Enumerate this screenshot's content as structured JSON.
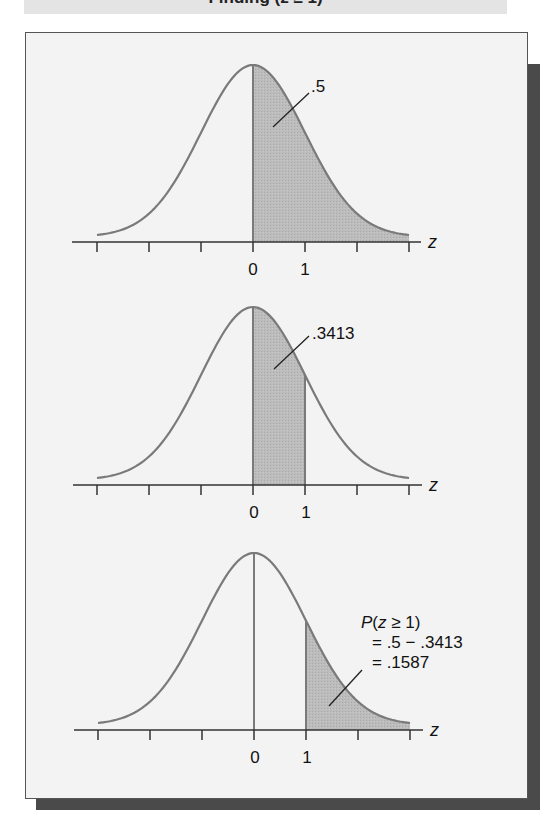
{
  "banner": {
    "title": "Finding (z ≥ 1)"
  },
  "colors": {
    "curve": "#7a7a7a",
    "shade": "#b9b9b9",
    "axis": "#333333",
    "frame_bg": "#f3f3f3",
    "shadow": "#4a4a4a"
  },
  "chart_data": [
    {
      "type": "area",
      "title": "Standard normal curve, area from z = 0 to +∞",
      "xlabel": "z",
      "ylabel": "",
      "x_ticks": [
        -3,
        -2,
        -1,
        0,
        1,
        2,
        3
      ],
      "x_tick_labels": [
        "",
        "",
        "",
        "0",
        "1",
        "",
        ""
      ],
      "xlim": [
        -3,
        3
      ],
      "shaded_interval": [
        0,
        3
      ],
      "annotation": ".5",
      "area": 0.5,
      "grid": false
    },
    {
      "type": "area",
      "title": "Standard normal curve, area from z = 0 to z = 1",
      "xlabel": "z",
      "ylabel": "",
      "x_ticks": [
        -3,
        -2,
        -1,
        0,
        1,
        2,
        3
      ],
      "x_tick_labels": [
        "",
        "",
        "",
        "0",
        "1",
        "",
        ""
      ],
      "xlim": [
        -3,
        3
      ],
      "shaded_interval": [
        0,
        1
      ],
      "annotation": ".3413",
      "area": 0.3413,
      "grid": false
    },
    {
      "type": "area",
      "title": "Standard normal curve, area for z ≥ 1",
      "xlabel": "z",
      "ylabel": "",
      "x_ticks": [
        -3,
        -2,
        -1,
        0,
        1,
        2,
        3
      ],
      "x_tick_labels": [
        "",
        "",
        "",
        "0",
        "1",
        "",
        ""
      ],
      "xlim": [
        -3,
        3
      ],
      "shaded_interval": [
        1,
        3
      ],
      "annotation_lines": [
        "P(z ≥ 1)",
        "= .5 − .3413",
        "= .1587"
      ],
      "area": 0.1587,
      "grid": false
    }
  ],
  "panels": [
    {
      "label": ".5",
      "tick0": "0",
      "tick1": "1",
      "axis_var": "z"
    },
    {
      "label": ".3413",
      "tick0": "0",
      "tick1": "1",
      "axis_var": "z"
    },
    {
      "label_p": "P",
      "label_open": "(",
      "label_z": "z",
      "label_rest": " ≥ 1)",
      "label_line2": "= .5 − .3413",
      "label_line3": "= .1587",
      "tick0": "0",
      "tick1": "1",
      "axis_var": "z"
    }
  ]
}
